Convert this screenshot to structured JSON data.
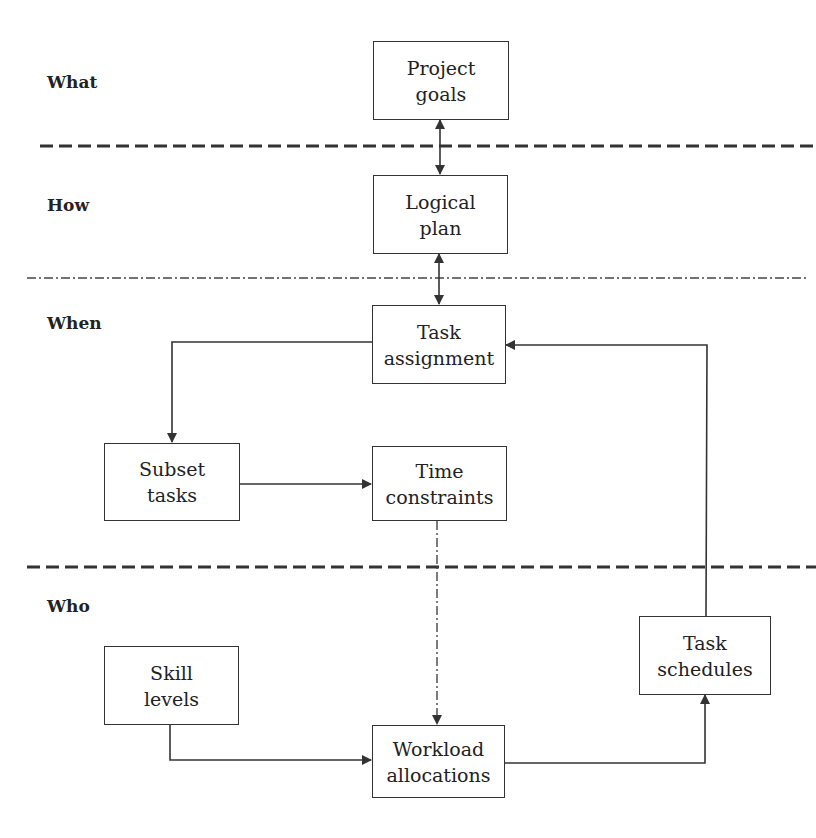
{
  "zones": [
    {
      "id": "what",
      "label": "What"
    },
    {
      "id": "how",
      "label": "How"
    },
    {
      "id": "when",
      "label": "When"
    },
    {
      "id": "who",
      "label": "Who"
    }
  ],
  "nodes": {
    "project_goals": "Project\ngoals",
    "logical_plan": "Logical\nplan",
    "task_assignment": "Task\nassignment",
    "subset_tasks": "Subset\ntasks",
    "time_constraints": "Time\nconstraints",
    "skill_levels": "Skill\nlevels",
    "workload_allocations": "Workload\nallocations",
    "task_schedules": "Task\nschedules"
  },
  "edges": [
    {
      "from": "Project goals",
      "to": "Logical plan",
      "style": "solid",
      "direction": "bidirectional"
    },
    {
      "from": "Logical plan",
      "to": "Task assignment",
      "style": "solid",
      "direction": "bidirectional"
    },
    {
      "from": "Task assignment",
      "to": "Subset tasks",
      "style": "solid",
      "direction": "forward"
    },
    {
      "from": "Subset tasks",
      "to": "Time constraints",
      "style": "solid",
      "direction": "forward"
    },
    {
      "from": "Time constraints",
      "to": "Workload allocations",
      "style": "dash-dot",
      "direction": "forward"
    },
    {
      "from": "Skill levels",
      "to": "Workload allocations",
      "style": "solid",
      "direction": "forward"
    },
    {
      "from": "Workload allocations",
      "to": "Task schedules",
      "style": "solid",
      "direction": "forward"
    },
    {
      "from": "Task schedules",
      "to": "Task assignment",
      "style": "solid",
      "direction": "forward"
    }
  ],
  "separators": [
    {
      "between": "What/How",
      "style": "dashed"
    },
    {
      "between": "How/When",
      "style": "dash-dot"
    },
    {
      "between": "When/Who",
      "style": "dashed"
    }
  ],
  "colors": {
    "line": "#333333",
    "text": "#222222",
    "background": "#ffffff"
  }
}
